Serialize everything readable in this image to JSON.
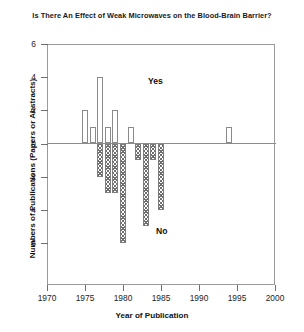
{
  "chart_data": {
    "type": "bar",
    "title": "Is There An Effect of Weak Microwaves on the Blood-Brain Barrier?",
    "xlabel": "Year of Publication",
    "ylabel": "Numbers of Publications (Papers or Abstracts)",
    "xlim": [
      1970,
      2000
    ],
    "ylim": [
      -6,
      6
    ],
    "xticks": [
      1970,
      1975,
      1980,
      1985,
      1990,
      1995,
      2000
    ],
    "xtick_labels": [
      "1970",
      "1975",
      "1980",
      "1985",
      "1990",
      "1995",
      "2000"
    ],
    "yticks": [
      6,
      4,
      2,
      0,
      -2,
      -4,
      -6
    ],
    "ytick_labels": [
      "6",
      "4",
      "2",
      "0",
      "2",
      "4",
      "6"
    ],
    "grid": false,
    "legend": "inline-annotations",
    "annotations": [
      {
        "text": "Yes",
        "x": 1984,
        "y": 4.2
      },
      {
        "text": "No",
        "x": 1985,
        "y": -5.1
      }
    ],
    "series": [
      {
        "name": "Yes",
        "direction": "up",
        "fill": "open",
        "color": "#ffffff",
        "edge_color": "#8a8a8a",
        "points": [
          {
            "year": 1975,
            "value": 2
          },
          {
            "year": 1976,
            "value": 1
          },
          {
            "year": 1977,
            "value": 4
          },
          {
            "year": 1978,
            "value": 1
          },
          {
            "year": 1979,
            "value": 2
          },
          {
            "year": 1981,
            "value": 1
          },
          {
            "year": 1994,
            "value": 1
          }
        ]
      },
      {
        "name": "No",
        "direction": "down",
        "fill": "hatched",
        "color": "#6e6e6e",
        "edge_color": "#7d7d7d",
        "points": [
          {
            "year": 1977,
            "value": -2
          },
          {
            "year": 1978,
            "value": -3
          },
          {
            "year": 1979,
            "value": -3
          },
          {
            "year": 1980,
            "value": -6
          },
          {
            "year": 1982,
            "value": -1
          },
          {
            "year": 1983,
            "value": -5
          },
          {
            "year": 1984,
            "value": -1
          },
          {
            "year": 1985,
            "value": -4
          }
        ]
      }
    ]
  }
}
